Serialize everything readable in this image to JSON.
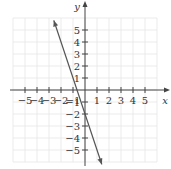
{
  "chart_data": {
    "type": "line",
    "title": "",
    "xlabel": "x",
    "ylabel": "y",
    "xlim": [
      -6,
      6
    ],
    "ylim": [
      -6,
      6
    ],
    "grid": true,
    "x_ticks": [
      -5,
      -4,
      -3,
      -2,
      -1,
      1,
      2,
      3,
      4,
      5
    ],
    "y_ticks": [
      -5,
      -4,
      -3,
      -2,
      -1,
      1,
      2,
      3,
      4,
      5
    ],
    "x_tick_labels": [
      "−5",
      "−4",
      "−3",
      "−2",
      "−1",
      "1",
      "2",
      "3",
      "4",
      "5"
    ],
    "y_tick_labels": [
      "−5",
      "−4",
      "−3",
      "−2",
      "−1",
      "1",
      "2",
      "3",
      "4",
      "5"
    ],
    "series": [
      {
        "name": "line",
        "equation": "y = -3x - 2",
        "slope": -3,
        "y_intercept": -2,
        "x_intercept": -0.667,
        "x": [
          -2.6,
          1.4
        ],
        "y": [
          5.8,
          -6.2
        ],
        "arrows": "both",
        "color": "#555555"
      }
    ]
  },
  "colors": {
    "axis": "#444444",
    "grid": "#e6e6e6",
    "line": "#555555",
    "text": "#333333"
  }
}
